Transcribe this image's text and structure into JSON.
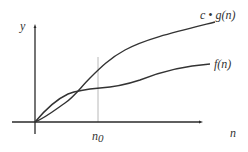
{
  "diagram": {
    "axes": {
      "x_label": "n",
      "y_label": "y"
    },
    "threshold": {
      "label": "n",
      "subscript": "0"
    },
    "curves": [
      {
        "id": "cg",
        "label": "c • g(n)",
        "color": "#333333"
      },
      {
        "id": "f",
        "label": "f(n)",
        "color": "#333333"
      }
    ],
    "colors": {
      "axis": "#2a2a2a",
      "curve": "#333333",
      "guide": "#b8b8b8",
      "background": "#ffffff"
    }
  }
}
